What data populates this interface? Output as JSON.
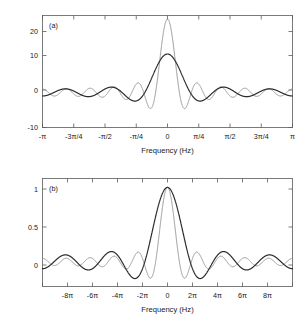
{
  "figure": {
    "background": "#ffffff",
    "axis_color": "#5a5a5a",
    "text_color": "#1a1a1a"
  },
  "chart_data": [
    {
      "type": "line",
      "panel_tag": "(a)",
      "title": "",
      "xlabel": "Frequency (Hz)",
      "ylabel": "",
      "xlim": [
        -3.14159265,
        3.14159265
      ],
      "ylim": [
        -10,
        22
      ],
      "grid": false,
      "legend": "none",
      "xticks": [
        -3.14159265,
        -2.35619449,
        -1.57079633,
        -0.78539816,
        0,
        0.78539816,
        1.57079633,
        2.35619449,
        3.14159265
      ],
      "xticklabels": [
        "-π",
        "-3π/4",
        "-π/2",
        "-π/4",
        "0",
        "π/4",
        "π/2",
        "3π/4",
        "π"
      ],
      "yticks": [
        -10,
        0,
        10,
        20
      ],
      "yticklabels": [
        "-10",
        "0",
        "10",
        "20"
      ],
      "series": [
        {
          "name": "narrow-window-spectrum",
          "color": "#8c8c8c",
          "linewidth": 0.9,
          "kernel": "dirichlet",
          "N": 21,
          "peak": 21,
          "first_null": 0.299,
          "first_sidelobe": -4.7
        },
        {
          "name": "wide-window-spectrum",
          "color": "#2b2b2b",
          "linewidth": 1.2,
          "kernel": "dirichlet",
          "N": 11,
          "peak": 11,
          "first_null": 0.571,
          "first_sidelobe": -2.4
        }
      ]
    },
    {
      "type": "line",
      "panel_tag": "(b)",
      "title": "",
      "xlabel": "Frequency (Hz)",
      "ylabel": "",
      "xlim": [
        -31.4159265,
        31.4159265
      ],
      "ylim": [
        -0.33,
        1.12
      ],
      "grid": false,
      "legend": "none",
      "xticks": [
        -25.1327412,
        -18.8495559,
        -12.5663706,
        -6.28318531,
        0,
        6.28318531,
        12.5663706,
        18.8495559,
        25.1327412
      ],
      "xticklabels": [
        "-8π",
        "-6π",
        "-4π",
        "-2π",
        "0",
        "2π",
        "4π",
        "6π",
        "8π"
      ],
      "yticks": [
        0,
        0.5,
        1
      ],
      "yticklabels": [
        "0",
        "0.5",
        "1"
      ],
      "series": [
        {
          "name": "narrow-window-spectrum-normalized",
          "color": "#8c8c8c",
          "linewidth": 0.9,
          "kernel": "dirichlet-normalized",
          "N": 21,
          "peak": 1,
          "first_null": 2.992,
          "first_sidelobe": -0.22
        },
        {
          "name": "wide-window-spectrum-normalized",
          "color": "#2b2b2b",
          "linewidth": 1.2,
          "kernel": "dirichlet-normalized",
          "N": 11,
          "peak": 1,
          "first_null": 5.712,
          "first_sidelobe": -0.24
        }
      ]
    }
  ]
}
